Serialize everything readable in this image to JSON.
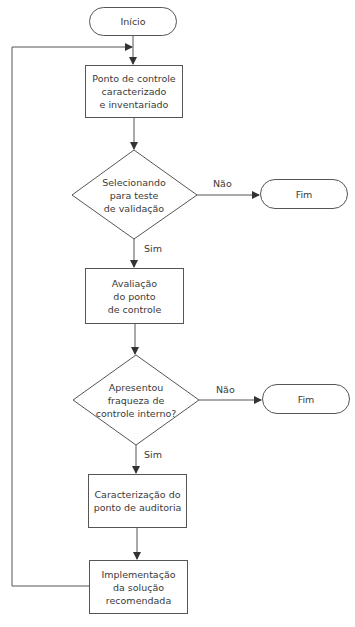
{
  "diagram": {
    "type": "flowchart",
    "nodes": {
      "start": {
        "shape": "terminator",
        "label": "Início"
      },
      "step1": {
        "shape": "process",
        "label": "Ponto de controle\ncaracterizado\ne inventariado"
      },
      "decision1": {
        "shape": "decision",
        "label": "Selecionando\npara teste\nde validação"
      },
      "end1": {
        "shape": "terminator",
        "label": "Fim"
      },
      "step2": {
        "shape": "process",
        "label": "Avaliação\ndo ponto\nde controle"
      },
      "decision2": {
        "shape": "decision",
        "label": "Apresentou\nfraqueza de\ncontrole interno?"
      },
      "end2": {
        "shape": "terminator",
        "label": "Fim"
      },
      "step3": {
        "shape": "process",
        "label": "Caracterização do\nponto de auditoria"
      },
      "step4": {
        "shape": "process",
        "label": "Implementação\nda solução\nrecomendada"
      }
    },
    "edge_labels": {
      "d1_no": "Não",
      "d1_yes": "Sim",
      "d2_no": "Não",
      "d2_yes": "Sim"
    },
    "edges": [
      {
        "from": "start",
        "to": "step1"
      },
      {
        "from": "step1",
        "to": "decision1"
      },
      {
        "from": "decision1",
        "to": "end1",
        "label": "Não"
      },
      {
        "from": "decision1",
        "to": "step2",
        "label": "Sim"
      },
      {
        "from": "step2",
        "to": "decision2"
      },
      {
        "from": "decision2",
        "to": "end2",
        "label": "Não"
      },
      {
        "from": "decision2",
        "to": "step3",
        "label": "Sim"
      },
      {
        "from": "step3",
        "to": "step4"
      },
      {
        "from": "step4",
        "to": "step1",
        "label": ""
      }
    ],
    "colors": {
      "line": "#444444",
      "text": "#3a3a3a",
      "background": "#ffffff"
    }
  }
}
